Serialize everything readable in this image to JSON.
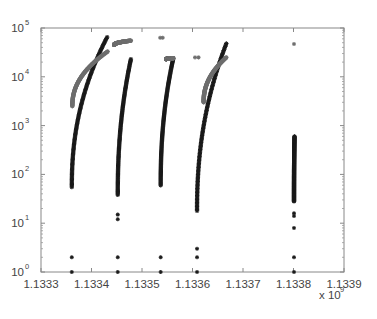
{
  "chart_data": {
    "type": "scatter",
    "title": "",
    "xlabel": "",
    "ylabel": "",
    "x_multiplier_label": "x 10",
    "x_multiplier_exponent": "9",
    "yscale": "log",
    "xlim": [
      1.1333,
      1.1339
    ],
    "ylim": [
      1,
      100000
    ],
    "grid": false,
    "legend": null,
    "x_ticks": [
      "1.1333",
      "1.1334",
      "1.1335",
      "1.1336",
      "1.1337",
      "1.1338",
      "1.1339"
    ],
    "x_tick_values": [
      1.1333,
      1.1334,
      1.1335,
      1.1336,
      1.1337,
      1.1338,
      1.1339
    ],
    "y_ticks": [
      {
        "base": "10",
        "exp": "0",
        "value": 1
      },
      {
        "base": "10",
        "exp": "1",
        "value": 10
      },
      {
        "base": "10",
        "exp": "2",
        "value": 100
      },
      {
        "base": "10",
        "exp": "3",
        "value": 1000
      },
      {
        "base": "10",
        "exp": "4",
        "value": 10000
      },
      {
        "base": "10",
        "exp": "5",
        "value": 100000
      }
    ],
    "marker": "asterisk",
    "series": [
      {
        "name": "black",
        "color": "#1a1a1a",
        "curves": [
          {
            "x_start": 1.133361,
            "x_end": 1.133431,
            "y_start": 55,
            "y_end": 65000
          },
          {
            "x_start": 1.133452,
            "x_end": 1.133478,
            "y_start": 38,
            "y_end": 23000
          },
          {
            "x_start": 1.133537,
            "x_end": 1.133562,
            "y_start": 60,
            "y_end": 24000
          },
          {
            "x_start": 1.133609,
            "x_end": 1.133667,
            "y_start": 18,
            "y_end": 48000
          },
          {
            "x_start": 1.133801,
            "x_end": 1.133802,
            "y_start": 28,
            "y_end": 600
          }
        ],
        "points": [
          {
            "x": 1.133361,
            "y": 1
          },
          {
            "x": 1.133361,
            "y": 2
          },
          {
            "x": 1.133452,
            "y": 1
          },
          {
            "x": 1.133452,
            "y": 2
          },
          {
            "x": 1.133452,
            "y": 12
          },
          {
            "x": 1.133452,
            "y": 15
          },
          {
            "x": 1.133537,
            "y": 1
          },
          {
            "x": 1.133537,
            "y": 2
          },
          {
            "x": 1.133609,
            "y": 1
          },
          {
            "x": 1.133609,
            "y": 2
          },
          {
            "x": 1.133609,
            "y": 3
          },
          {
            "x": 1.133801,
            "y": 1
          },
          {
            "x": 1.133801,
            "y": 2
          },
          {
            "x": 1.133801,
            "y": 8
          },
          {
            "x": 1.133801,
            "y": 14
          },
          {
            "x": 1.133801,
            "y": 16
          }
        ]
      },
      {
        "name": "gray",
        "color": "#6e6e6e",
        "curves": [
          {
            "x_start": 1.133362,
            "x_end": 1.133432,
            "y_start": 2500,
            "y_end": 33000
          },
          {
            "x_start": 1.133445,
            "x_end": 1.133478,
            "y_start": 45000,
            "y_end": 55000
          },
          {
            "x_start": 1.133548,
            "x_end": 1.133562,
            "y_start": 23000,
            "y_end": 24000
          },
          {
            "x_start": 1.133622,
            "x_end": 1.133667,
            "y_start": 3000,
            "y_end": 25000
          }
        ],
        "points": [
          {
            "x": 1.133536,
            "y": 63000
          },
          {
            "x": 1.133541,
            "y": 63000
          },
          {
            "x": 1.133605,
            "y": 25000
          },
          {
            "x": 1.133612,
            "y": 25000
          },
          {
            "x": 1.133801,
            "y": 47000
          }
        ]
      }
    ]
  }
}
